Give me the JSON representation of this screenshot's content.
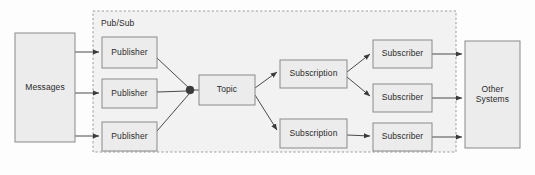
{
  "diagram": {
    "background_color": "#fdfdfd",
    "box_fill_color": "#ececec",
    "box_border_color": "#8a8a8a",
    "group_fill_color": "#f2f2f2",
    "group_border_color": "#9a9a9a",
    "edge_color": "#4a4a4a",
    "text_color": "#2b2b2b",
    "group": {
      "label": "Pub/Sub",
      "label_x": 101,
      "label_y": 24,
      "x": 93,
      "y": 11,
      "width": 363,
      "height": 141
    },
    "nodes": [
      {
        "id": "messages",
        "label": "Messages",
        "x": 15,
        "y": 33,
        "width": 60,
        "height": 109
      },
      {
        "id": "publisher1",
        "label": "Publisher",
        "x": 102,
        "y": 37,
        "width": 55,
        "height": 31
      },
      {
        "id": "publisher2",
        "label": "Publisher",
        "x": 102,
        "y": 79,
        "width": 55,
        "height": 29
      },
      {
        "id": "publisher3",
        "label": "Publisher",
        "x": 102,
        "y": 122,
        "width": 55,
        "height": 29
      },
      {
        "id": "topic",
        "label": "Topic",
        "x": 199,
        "y": 75,
        "width": 56,
        "height": 30
      },
      {
        "id": "subscription1",
        "label": "Subscription",
        "x": 280,
        "y": 60,
        "width": 67,
        "height": 28
      },
      {
        "id": "subscription2",
        "label": "Subscription",
        "x": 280,
        "y": 119,
        "width": 67,
        "height": 29
      },
      {
        "id": "subscriber1",
        "label": "Subscriber",
        "x": 373,
        "y": 40,
        "width": 59,
        "height": 28
      },
      {
        "id": "subscriber2",
        "label": "Subscriber",
        "x": 373,
        "y": 84,
        "width": 59,
        "height": 28
      },
      {
        "id": "subscriber3",
        "label": "Subscriber",
        "x": 373,
        "y": 123,
        "width": 59,
        "height": 28
      },
      {
        "id": "othersystems",
        "label": "Other Systems",
        "x": 465,
        "y": 41,
        "width": 55,
        "height": 107
      }
    ],
    "junction": {
      "x": 190,
      "y": 90,
      "radius": 4
    },
    "edges": [
      {
        "id": "messages-to-publisher1",
        "from": "messages",
        "to": "publisher1",
        "arrow": true,
        "path": "M 75 52 L 99 52"
      },
      {
        "id": "messages-to-publisher2",
        "from": "messages",
        "to": "publisher2",
        "arrow": true,
        "path": "M 75 93 L 99 93"
      },
      {
        "id": "messages-to-publisher3",
        "from": "messages",
        "to": "publisher3",
        "arrow": true,
        "path": "M 75 136 L 99 136"
      },
      {
        "id": "publisher1-to-junction",
        "from": "publisher1",
        "to": "topic",
        "arrow": false,
        "path": "M 157 58 L 189 88"
      },
      {
        "id": "publisher2-to-junction",
        "from": "publisher2",
        "to": "topic",
        "arrow": false,
        "path": "M 157 92 L 187 91"
      },
      {
        "id": "publisher3-to-junction",
        "from": "publisher3",
        "to": "topic",
        "arrow": false,
        "path": "M 157 131 L 189 94"
      },
      {
        "id": "junction-to-topic",
        "from": "topic",
        "to": "topic",
        "arrow": false,
        "path": "M 192 90 L 199 90"
      },
      {
        "id": "topic-to-subscription1",
        "from": "topic",
        "to": "subscription1",
        "arrow": true,
        "path": "M 255 88 L 277 72"
      },
      {
        "id": "topic-to-subscription2",
        "from": "topic",
        "to": "subscription2",
        "arrow": true,
        "path": "M 255 95 L 277 130"
      },
      {
        "id": "subscription1-to-subscriber1",
        "from": "subscription1",
        "to": "subscriber1",
        "arrow": true,
        "path": "M 347 72 L 370 54"
      },
      {
        "id": "subscription1-to-subscriber2",
        "from": "subscription1",
        "to": "subscriber2",
        "arrow": true,
        "path": "M 347 77 L 370 96"
      },
      {
        "id": "subscription2-to-subscriber3",
        "from": "subscription2",
        "to": "subscriber3",
        "arrow": true,
        "path": "M 347 135 L 370 136"
      },
      {
        "id": "subscriber1-to-othersystems",
        "from": "subscriber1",
        "to": "othersystems",
        "arrow": true,
        "path": "M 432 54 L 462 54"
      },
      {
        "id": "subscriber2-to-othersystems",
        "from": "subscriber2",
        "to": "othersystems",
        "arrow": true,
        "path": "M 432 98 L 462 98"
      },
      {
        "id": "subscriber3-to-othersystems",
        "from": "subscriber3",
        "to": "othersystems",
        "arrow": true,
        "path": "M 432 137 L 462 137"
      }
    ]
  }
}
